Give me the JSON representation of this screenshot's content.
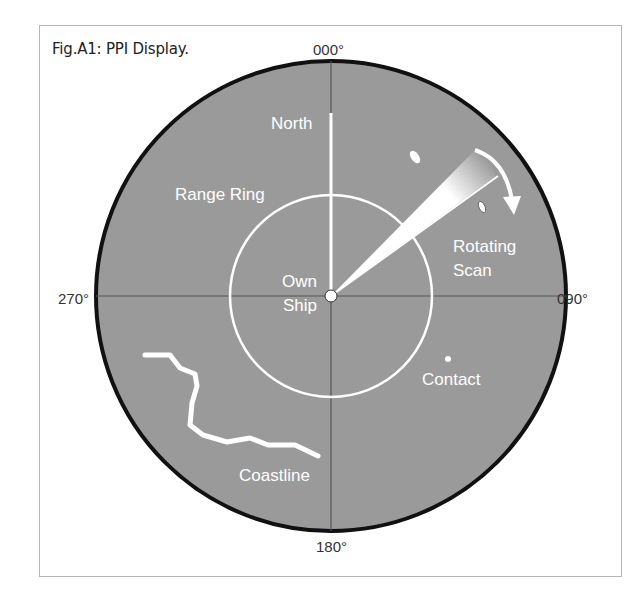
{
  "figure": {
    "title": "Fig.A1: PPI Display."
  },
  "bearings": {
    "north": "000°",
    "east": "090°",
    "south": "180°",
    "west": "270°"
  },
  "labels": {
    "north": "North",
    "range_ring": "Range Ring",
    "own_ship_line1": "Own",
    "own_ship_line2": "Ship",
    "rotating_line1": "Rotating",
    "rotating_line2": "Scan",
    "contact": "Contact",
    "coastline": "Coastline"
  },
  "colors": {
    "scope_fill": "#9a9a9a",
    "scope_border": "#111111",
    "overlay": "#ffffff",
    "crosshair": "#555555"
  }
}
